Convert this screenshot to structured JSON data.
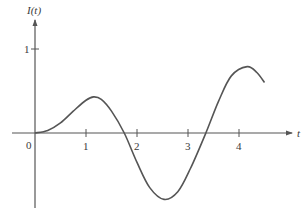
{
  "chart_data": {
    "type": "line",
    "title": "",
    "xlabel": "t",
    "ylabel": "I(t)",
    "xlim": [
      -0.5,
      5.3
    ],
    "ylim": [
      -0.95,
      1.25
    ],
    "grid": false,
    "legend": null,
    "x_ticks": [
      0,
      1,
      2,
      3,
      4
    ],
    "x_tick_labels": [
      "0",
      "1",
      "2",
      "3",
      "4"
    ],
    "y_ticks": [
      1
    ],
    "y_tick_labels": [
      "1"
    ],
    "series": [
      {
        "name": "I(t)",
        "x": [
          0,
          0.25,
          0.5,
          0.75,
          1.0,
          1.15,
          1.3,
          1.5,
          1.75,
          2.0,
          2.25,
          2.53,
          2.8,
          3.05,
          3.35,
          3.6,
          3.85,
          4.16,
          4.35,
          4.5
        ],
        "values": [
          0,
          0.03,
          0.12,
          0.26,
          0.39,
          0.43,
          0.4,
          0.26,
          0.0,
          -0.35,
          -0.65,
          -0.79,
          -0.7,
          -0.42,
          0.0,
          0.38,
          0.68,
          0.79,
          0.72,
          0.6
        ]
      }
    ],
    "color": "#555555"
  },
  "labels": {
    "x_axis": "t",
    "y_axis": "I(t)",
    "origin": "0"
  }
}
